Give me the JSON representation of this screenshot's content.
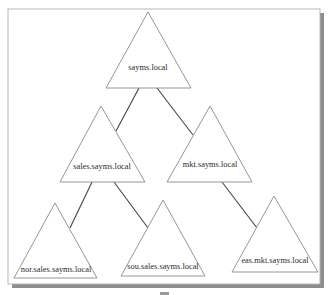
{
  "diagram": {
    "type": "domain-tree",
    "root": "sayms.local",
    "nodes": [
      {
        "id": "root",
        "label": "sayms.local",
        "parent": null
      },
      {
        "id": "sales",
        "label": "sales.sayms.local",
        "parent": "root"
      },
      {
        "id": "mkt",
        "label": "mkt.sayms.local",
        "parent": "root"
      },
      {
        "id": "nor",
        "label": "nor.sales.sayms.local",
        "parent": "sales"
      },
      {
        "id": "sou",
        "label": "sou.sales.sayms.local",
        "parent": "sales"
      },
      {
        "id": "eas",
        "label": "eas.mkt.sayms.local",
        "parent": "mkt"
      }
    ],
    "edges": [
      {
        "from": "root",
        "to": "sales"
      },
      {
        "from": "root",
        "to": "mkt"
      },
      {
        "from": "sales",
        "to": "nor"
      },
      {
        "from": "sales",
        "to": "sou"
      },
      {
        "from": "mkt",
        "to": "eas"
      }
    ],
    "colors": {
      "background": "#ffffff",
      "triangle_stroke": "#8a8a8a",
      "edge": "#444444",
      "frame_shadow": "#8d8d8d",
      "text": "#2a2a2a"
    }
  }
}
